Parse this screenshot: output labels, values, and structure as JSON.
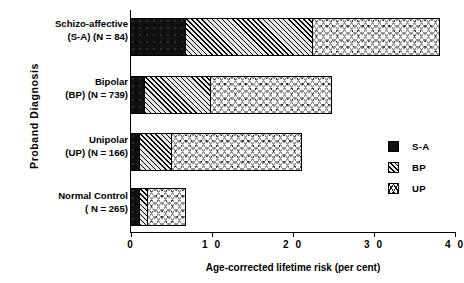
{
  "chart_data": {
    "type": "bar",
    "orientation": "horizontal",
    "stacked": true,
    "title": "",
    "xlabel": "Age-corrected lifetime risk (per cent)",
    "ylabel": "Proband  Diagnosis",
    "xlim": [
      0,
      40
    ],
    "xticks": [
      0,
      10,
      20,
      30,
      40
    ],
    "xticklabels": [
      "0",
      "1 0",
      "2 0",
      "3 0",
      "4 0"
    ],
    "grid": false,
    "legend_position": "right",
    "categories": [
      "Schizo-affective (S-A) (N = 84)",
      "Bipolar (BP) (N = 739)",
      "Unipolar (UP) (N = 166)",
      "Normal Control ( N = 265)"
    ],
    "category_lines": [
      [
        "Schizo-affective",
        "(S-A) (N = 84)"
      ],
      [
        "Bipolar",
        "(BP) (N = 739)"
      ],
      [
        "Unipolar",
        "(UP) (N = 166)"
      ],
      [
        "Normal Control",
        "( N = 265)"
      ]
    ],
    "series": [
      {
        "name": "S-A",
        "pattern": "solid-black",
        "values": [
          6.8,
          1.7,
          1.1,
          1.1
        ]
      },
      {
        "name": "BP",
        "pattern": "diagonal-hatch",
        "values": [
          15.7,
          8.2,
          4.0,
          1.0
        ]
      },
      {
        "name": "UP",
        "pattern": "cross-hatch",
        "values": [
          15.6,
          14.9,
          16.0,
          4.7
        ]
      }
    ],
    "totals": [
      38.1,
      24.8,
      21.1,
      6.8
    ],
    "legend": [
      {
        "label": "S-A",
        "pattern": "solid-black"
      },
      {
        "label": "BP",
        "pattern": "diagonal-hatch"
      },
      {
        "label": "UP",
        "pattern": "cross-hatch"
      }
    ],
    "colors": {
      "ink": "#000000",
      "sa_fill": "#111111",
      "bp_fill": "#e9e9e9",
      "up_fill": "#fafafa",
      "background": "#ffffff"
    }
  }
}
